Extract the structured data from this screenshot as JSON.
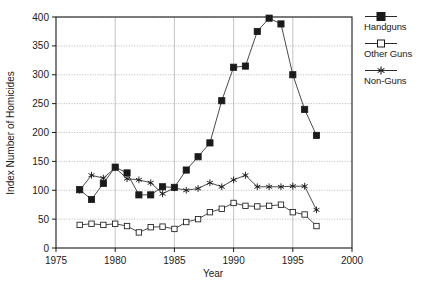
{
  "chart_data": {
    "type": "line",
    "title": "",
    "xlabel": "Year",
    "ylabel": "Index Number of Homicides",
    "xlim": [
      1975,
      2000
    ],
    "ylim": [
      0,
      400
    ],
    "xticks": [
      1975,
      1980,
      1985,
      1990,
      1995,
      2000
    ],
    "yticks": [
      0,
      50,
      100,
      150,
      200,
      250,
      300,
      350,
      400
    ],
    "xtick_labels": [
      "1975",
      "1980",
      "1985",
      "1990",
      "1995",
      "2000"
    ],
    "ytick_labels": [
      "0",
      "50",
      "100",
      "150",
      "200",
      "250",
      "300",
      "350",
      "400"
    ],
    "grid": true,
    "legend_position": "right-outside",
    "x": [
      1977,
      1978,
      1979,
      1980,
      1981,
      1982,
      1983,
      1984,
      1985,
      1986,
      1987,
      1988,
      1989,
      1990,
      1991,
      1992,
      1993,
      1994,
      1995,
      1996,
      1997
    ],
    "series": [
      {
        "name": "Handguns",
        "marker": "filled-square",
        "values": [
          101,
          84,
          112,
          140,
          130,
          92,
          92,
          106,
          105,
          135,
          158,
          182,
          255,
          313,
          315,
          375,
          398,
          388,
          300,
          240,
          195
        ]
      },
      {
        "name": "Other Guns",
        "marker": "open-square",
        "values": [
          40,
          42,
          40,
          42,
          38,
          27,
          36,
          37,
          33,
          45,
          50,
          62,
          68,
          78,
          73,
          72,
          73,
          75,
          62,
          58,
          38
        ]
      },
      {
        "name": "Non-Guns",
        "marker": "asterisk",
        "values": [
          100,
          126,
          121,
          139,
          120,
          118,
          113,
          94,
          104,
          100,
          103,
          113,
          106,
          118,
          126,
          106,
          106,
          106,
          107,
          107,
          66
        ]
      }
    ]
  },
  "legend": {
    "entries": [
      {
        "label": "Handguns",
        "marker": "filled-square"
      },
      {
        "label": "Other Guns",
        "marker": "open-square"
      },
      {
        "label": "Non-Guns",
        "marker": "asterisk"
      }
    ]
  },
  "colors": {
    "line": "#2b2b2b",
    "grid": "#9a9a9a",
    "axis": "#1a1a1a",
    "background": "#ffffff"
  }
}
